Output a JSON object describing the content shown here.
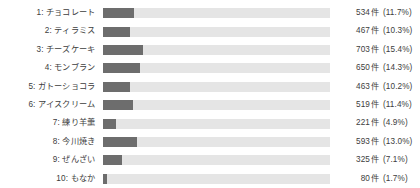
{
  "chart_data": {
    "type": "bar",
    "title": "",
    "xlabel": "",
    "ylabel": "",
    "orientation": "horizontal",
    "grid": false,
    "legend": false,
    "unit": "件",
    "xlim": [
      0,
      100
    ],
    "categories": [
      "1: チョコレート",
      "2: ティラミス",
      "3: チーズケーキ",
      "4: モンブラン",
      "5: ガトーショコラ",
      "6: アイスクリーム",
      "7: 練り羊羹",
      "8: 今川焼き",
      "9: ぜんざい",
      "10: もなか"
    ],
    "values": [
      534,
      467,
      703,
      650,
      463,
      519,
      221,
      593,
      325,
      80
    ],
    "percents": [
      11.7,
      10.3,
      15.4,
      14.3,
      10.2,
      11.4,
      4.9,
      13.0,
      7.1,
      1.7
    ],
    "rows": [
      {
        "label": "1: チョコレート",
        "count": "534",
        "unit": "件",
        "pct": "(11.7%)",
        "pct_value": 11.7
      },
      {
        "label": "2: ティラミス",
        "count": "467",
        "unit": "件",
        "pct": "(10.3%)",
        "pct_value": 10.3
      },
      {
        "label": "3: チーズケーキ",
        "count": "703",
        "unit": "件",
        "pct": "(15.4%)",
        "pct_value": 15.4
      },
      {
        "label": "4: モンブラン",
        "count": "650",
        "unit": "件",
        "pct": "(14.3%)",
        "pct_value": 14.3
      },
      {
        "label": "5: ガトーショコラ",
        "count": "463",
        "unit": "件",
        "pct": "(10.2%)",
        "pct_value": 10.2
      },
      {
        "label": "6: アイスクリーム",
        "count": "519",
        "unit": "件",
        "pct": "(11.4%)",
        "pct_value": 11.4
      },
      {
        "label": "7: 練り羊羹",
        "count": "221",
        "unit": "件",
        "pct": "(4.9%)",
        "pct_value": 4.9
      },
      {
        "label": "8: 今川焼き",
        "count": "593",
        "unit": "件",
        "pct": "(13.0%)",
        "pct_value": 13.0
      },
      {
        "label": "9: ぜんざい",
        "count": "325",
        "unit": "件",
        "pct": "(7.1%)",
        "pct_value": 7.1
      },
      {
        "label": "10: もなか",
        "count": "80",
        "unit": "件",
        "pct": "(1.7%)",
        "pct_value": 1.7
      }
    ],
    "colors": {
      "bar_fill": "#6d6d6d",
      "bar_track": "#e5e5e5",
      "text": "#3d3d3d",
      "background": "#ffffff"
    },
    "bar_scale_px_per_percent": 2.62
  }
}
